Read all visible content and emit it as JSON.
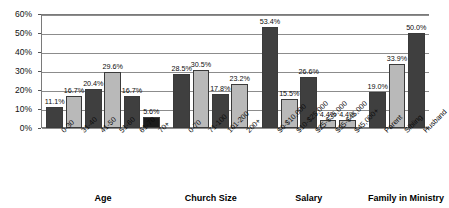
{
  "chart_data": {
    "type": "bar",
    "title": "",
    "xlabel": "",
    "ylabel": "",
    "ylim": [
      0,
      60
    ],
    "ytick_labels": [
      "0%",
      "10%",
      "20%",
      "30%",
      "40%",
      "50%",
      "60%"
    ],
    "ytick_values": [
      0,
      10,
      20,
      30,
      40,
      50,
      60
    ],
    "grid": true,
    "legend": "none",
    "value_label_format": "percent-one-decimal",
    "groups": [
      {
        "name": "Age",
        "categories": [
          "0-30",
          "31-40",
          "41-50",
          "51-60",
          "61-70",
          "70+"
        ],
        "values": [
          11.1,
          16.7,
          20.4,
          29.6,
          16.7,
          5.6
        ],
        "value_labels": [
          "11.1%",
          "16.7%",
          "20.4%",
          "29.6%",
          "16.7%",
          "5.6%"
        ],
        "shades": [
          "dark",
          "light",
          "dark",
          "light",
          "dark",
          "black"
        ]
      },
      {
        "name": "Church Size",
        "categories": [
          "0-70",
          "71-100",
          "101-200",
          "200+"
        ],
        "values": [
          28.5,
          30.5,
          17.8,
          23.2
        ],
        "value_labels": [
          "28.5%",
          "30.5%",
          "17.8%",
          "23.2%"
        ],
        "shades": [
          "dark",
          "light",
          "dark",
          "light"
        ]
      },
      {
        "name": "Salary",
        "categories": [
          "$0-$10,000",
          "$10-$25,000",
          "$25-$35,000",
          "$35-$45,000",
          "$45,000+"
        ],
        "values": [
          53.4,
          15.5,
          26.6,
          4.4,
          4.4
        ],
        "value_labels": [
          "53.4%",
          "15.5%",
          "26.6%",
          "4.4%",
          "4.4%"
        ],
        "shades": [
          "dark",
          "light",
          "dark",
          "light",
          "light"
        ]
      },
      {
        "name": "Family in Ministry",
        "categories": [
          "Parent",
          "Sibling",
          "Husband"
        ],
        "values": [
          19.0,
          33.9,
          50.0
        ],
        "value_labels": [
          "19.0%",
          "33.9%",
          "50.0%"
        ],
        "shades": [
          "dark",
          "light",
          "dark"
        ]
      }
    ],
    "colors": {
      "dark": "#3f3f3f",
      "light": "#b9b9b9",
      "black": "#1b1b1b",
      "grid": "#8c8c8c",
      "axis": "#7a7a7a",
      "background": "#ffffff",
      "text": "#000000"
    }
  }
}
